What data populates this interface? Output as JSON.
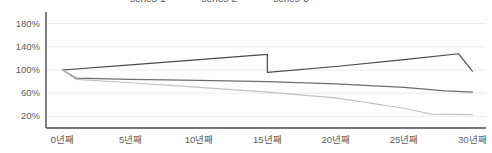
{
  "chart_data": {
    "type": "line",
    "title": "",
    "xlabel": "",
    "ylabel": "",
    "x": [
      "0년째",
      "5년째",
      "10년째",
      "15년째",
      "20년째",
      "25년째",
      "30년째"
    ],
    "xtick_labels": [
      "0년째",
      "5년째",
      "10년째",
      "15년째",
      "20년째",
      "25년째",
      "30년째"
    ],
    "ytick_labels": [
      "180%",
      "140%",
      "100%",
      "60%",
      "20%"
    ],
    "ytick_values": [
      180,
      140,
      100,
      60,
      20
    ],
    "ylim": [
      0,
      200
    ],
    "xlim": [
      -1.2,
      31
    ],
    "grid": true,
    "grid_axis": "y",
    "legend": "top",
    "series": [
      {
        "name": "series-1",
        "color": "#4a4a4a",
        "x": [
          0,
          5,
          10,
          15,
          15,
          20,
          25,
          29,
          30
        ],
        "values": [
          100,
          109,
          118,
          127,
          96,
          106,
          118,
          128,
          98
        ]
      },
      {
        "name": "series-2",
        "color": "#6e6e6e",
        "x": [
          0,
          1,
          5,
          10,
          15,
          20,
          25,
          28,
          30
        ],
        "values": [
          100,
          86,
          84,
          82,
          80,
          76,
          70,
          64,
          62
        ]
      },
      {
        "name": "series-3",
        "color": "#c2c2c2",
        "x": [
          0,
          1,
          5,
          10,
          15,
          20,
          25,
          27,
          30
        ],
        "values": [
          100,
          84,
          78,
          70,
          62,
          52,
          34,
          24,
          23
        ]
      }
    ],
    "colors": {
      "axis": "#4a4a4a",
      "grid": "#ececec",
      "tick_text": "#5d5d5d",
      "background": "#ffffff"
    }
  }
}
